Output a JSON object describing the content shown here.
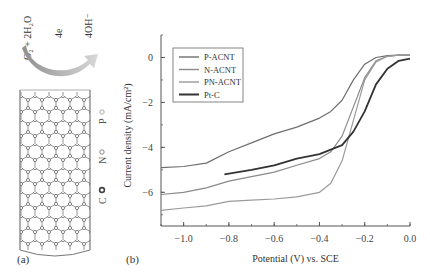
{
  "panel_a": {
    "label": "(a)",
    "reaction": {
      "reactant": "O₂ + 2H₂O",
      "electrons": "4e",
      "product": "4OH⁻"
    },
    "legend": [
      {
        "symbol": "P",
        "marker": "light-open-circle"
      },
      {
        "symbol": "N",
        "marker": "gray-open-circle"
      },
      {
        "symbol": "C",
        "marker": "dark-ring"
      }
    ]
  },
  "panel_b": {
    "label": "(b)"
  },
  "chart_data": {
    "type": "line",
    "title": "",
    "xlabel": "Potential (V) vs. SCE",
    "ylabel": "Current density (mA/cm²)",
    "xlim": [
      -1.1,
      0.0
    ],
    "ylim": [
      -7.5,
      1.0
    ],
    "xticks": [
      "-1.0",
      "-0.8",
      "-0.6",
      "-0.4",
      "-0.2",
      "0.0"
    ],
    "yticks": [
      "0",
      "-2",
      "-4",
      "-6"
    ],
    "grid": false,
    "legend_position": "upper-left",
    "series": [
      {
        "name": "P-ACNT",
        "color": "#6e6e6e",
        "x": [
          -1.1,
          -1.0,
          -0.9,
          -0.8,
          -0.7,
          -0.6,
          -0.5,
          -0.4,
          -0.35,
          -0.3,
          -0.25,
          -0.2,
          -0.15,
          -0.1,
          -0.05,
          0.0
        ],
        "y": [
          -4.9,
          -4.85,
          -4.7,
          -4.2,
          -3.8,
          -3.4,
          -3.1,
          -2.7,
          -2.4,
          -1.9,
          -1.0,
          -0.3,
          0.0,
          0.08,
          0.1,
          0.1
        ]
      },
      {
        "name": "N-ACNT",
        "color": "#8a8a8a",
        "x": [
          -1.1,
          -1.0,
          -0.9,
          -0.8,
          -0.7,
          -0.6,
          -0.5,
          -0.4,
          -0.35,
          -0.3,
          -0.25,
          -0.2,
          -0.15,
          -0.1,
          -0.05,
          0.0
        ],
        "y": [
          -6.1,
          -6.0,
          -5.8,
          -5.5,
          -5.3,
          -5.1,
          -4.8,
          -4.5,
          -4.2,
          -3.5,
          -2.2,
          -0.9,
          -0.15,
          0.05,
          0.1,
          0.1
        ]
      },
      {
        "name": "PN-ACNT",
        "color": "#9a9a9a",
        "x": [
          -1.1,
          -1.0,
          -0.9,
          -0.8,
          -0.7,
          -0.6,
          -0.5,
          -0.4,
          -0.35,
          -0.3,
          -0.25,
          -0.2,
          -0.15,
          -0.1,
          -0.05,
          0.0
        ],
        "y": [
          -6.8,
          -6.7,
          -6.6,
          -6.4,
          -6.35,
          -6.3,
          -6.2,
          -6.0,
          -5.6,
          -4.6,
          -2.8,
          -1.0,
          -0.2,
          0.05,
          0.1,
          0.1
        ]
      },
      {
        "name": "Pt-C",
        "color": "#333333",
        "x": [
          -0.82,
          -0.7,
          -0.6,
          -0.5,
          -0.4,
          -0.3,
          -0.25,
          -0.2,
          -0.15,
          -0.1,
          -0.05,
          0.0
        ],
        "y": [
          -5.2,
          -5.0,
          -4.8,
          -4.5,
          -4.3,
          -3.9,
          -3.3,
          -2.4,
          -1.2,
          -0.5,
          -0.15,
          -0.05
        ]
      }
    ]
  }
}
